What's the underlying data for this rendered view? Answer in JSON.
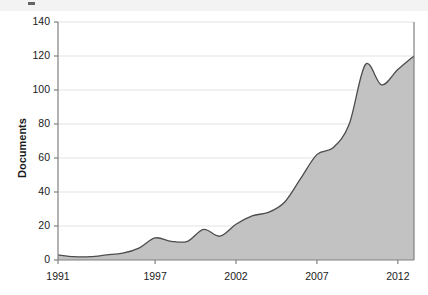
{
  "figure": {
    "caption_strip_text": "",
    "background_color": "#ffffff"
  },
  "chart_data": {
    "type": "area",
    "title": "",
    "xlabel": "",
    "ylabel": "Documents",
    "xlim": [
      1991,
      2013
    ],
    "ylim": [
      0,
      140
    ],
    "yticks": [
      0,
      20,
      40,
      60,
      80,
      100,
      120,
      140
    ],
    "ytick_labels": [
      "0",
      "20",
      "40",
      "60",
      "80",
      "100",
      "120",
      "140"
    ],
    "xticks": [
      1991,
      1997,
      2002,
      2007,
      2012
    ],
    "xtick_labels": [
      "1991",
      "1997",
      "2002",
      "2007",
      "2012"
    ],
    "grid": "horizontal",
    "legend": "none",
    "area_fill_color": "#c2c2c2",
    "line_color": "#4d4d4d",
    "axis_color": "#808080",
    "gridline_color": "#e3e3e3",
    "series": [
      {
        "name": "Documents",
        "x": [
          1991,
          1992,
          1993,
          1994,
          1995,
          1996,
          1997,
          1998,
          1999,
          2000,
          2001,
          2002,
          2003,
          2004,
          2005,
          2006,
          2007,
          2008,
          2009,
          2010,
          2011,
          2012,
          2013
        ],
        "values": [
          3,
          2,
          2,
          3,
          4,
          7,
          13,
          11,
          11,
          18,
          14,
          21,
          26,
          28,
          34,
          48,
          62,
          66,
          80,
          115,
          103,
          112,
          120
        ]
      }
    ],
    "annotations": []
  },
  "plot_geometry": {
    "left": 58,
    "right": 414,
    "top": 22,
    "bottom": 260
  }
}
